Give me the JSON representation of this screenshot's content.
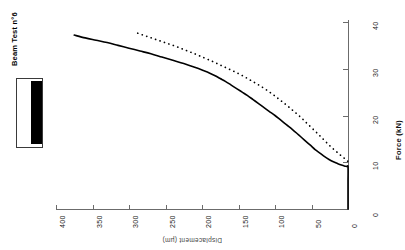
{
  "chart_data": {
    "type": "line",
    "title": "Beam Test n°6",
    "xlabel": "Displacement (µm)",
    "ylabel": "Force  (kN)",
    "xlim": [
      400,
      0
    ],
    "ylim": [
      0,
      40
    ],
    "x_ticks": [
      "400",
      "350",
      "300",
      "250",
      "200",
      "150",
      "100",
      "50",
      "0"
    ],
    "y_ticks": [
      "0",
      "10",
      "20",
      "30",
      "40"
    ],
    "grid": false,
    "x_axis_direction": "reversed",
    "legend": {
      "position": "left",
      "entries": [
        {
          "name": "Beam Test n°6",
          "style": "solid-block"
        }
      ]
    },
    "series": [
      {
        "name": "Beam Test n°6 experimental",
        "style": "solid",
        "points": [
          [
            375,
            37.2
          ],
          [
            360,
            36.6
          ],
          [
            345,
            36.1
          ],
          [
            330,
            35.6
          ],
          [
            315,
            35.0
          ],
          [
            300,
            34.4
          ],
          [
            285,
            33.8
          ],
          [
            270,
            33.2
          ],
          [
            255,
            32.5
          ],
          [
            240,
            31.8
          ],
          [
            225,
            31.1
          ],
          [
            210,
            30.3
          ],
          [
            198,
            29.6
          ],
          [
            190,
            29.1
          ],
          [
            182,
            28.5
          ],
          [
            175,
            27.9
          ],
          [
            168,
            27.3
          ],
          [
            160,
            26.5
          ],
          [
            152,
            25.7
          ],
          [
            145,
            25.0
          ],
          [
            138,
            24.3
          ],
          [
            130,
            23.4
          ],
          [
            122,
            22.5
          ],
          [
            115,
            21.7
          ],
          [
            108,
            20.9
          ],
          [
            100,
            20.0
          ],
          [
            92,
            19.0
          ],
          [
            84,
            18.0
          ],
          [
            76,
            17.0
          ],
          [
            68,
            15.9
          ],
          [
            60,
            14.8
          ],
          [
            52,
            13.7
          ],
          [
            45,
            12.7
          ],
          [
            38,
            11.9
          ],
          [
            32,
            11.2
          ],
          [
            26,
            10.6
          ],
          [
            20,
            10.1
          ],
          [
            14,
            9.7
          ],
          [
            9,
            9.4
          ],
          [
            5,
            9.2
          ],
          [
            2,
            9.1
          ],
          [
            0,
            9.0
          ],
          [
            0,
            6.0
          ],
          [
            0,
            3.0
          ],
          [
            0,
            0.0
          ]
        ]
      },
      {
        "name": "Beam Test n°6 model",
        "style": "dotted",
        "points": [
          [
            288,
            37.6
          ],
          [
            275,
            36.9
          ],
          [
            262,
            36.2
          ],
          [
            249,
            35.5
          ],
          [
            236,
            34.8
          ],
          [
            223,
            34.0
          ],
          [
            210,
            33.2
          ],
          [
            198,
            32.4
          ],
          [
            186,
            31.6
          ],
          [
            175,
            30.8
          ],
          [
            164,
            30.0
          ],
          [
            153,
            29.2
          ],
          [
            142,
            28.3
          ],
          [
            132,
            27.4
          ],
          [
            122,
            26.5
          ],
          [
            112,
            25.5
          ],
          [
            102,
            24.4
          ],
          [
            93,
            23.3
          ],
          [
            84,
            22.2
          ],
          [
            75,
            21.0
          ],
          [
            66,
            19.8
          ],
          [
            58,
            18.6
          ],
          [
            50,
            17.4
          ],
          [
            42,
            16.2
          ],
          [
            35,
            15.1
          ],
          [
            28,
            14.0
          ],
          [
            22,
            13.1
          ],
          [
            16,
            12.3
          ],
          [
            11,
            11.6
          ],
          [
            7,
            11.1
          ],
          [
            4,
            10.7
          ],
          [
            2,
            10.4
          ],
          [
            0,
            10.2
          ]
        ]
      }
    ]
  },
  "axes": {
    "force": {
      "title": "Force  (kN)",
      "ticks": [
        {
          "label": "0",
          "value": 0
        },
        {
          "label": "10",
          "value": 10
        },
        {
          "label": "20",
          "value": 20
        },
        {
          "label": "30",
          "value": 30
        },
        {
          "label": "40",
          "value": 40
        }
      ]
    },
    "displacement": {
      "title": "Displacement (µm)",
      "ticks": [
        {
          "label": "400",
          "value": 400
        },
        {
          "label": "350",
          "value": 350
        },
        {
          "label": "300",
          "value": 300
        },
        {
          "label": "250",
          "value": 250
        },
        {
          "label": "200",
          "value": 200
        },
        {
          "label": "150",
          "value": 150
        },
        {
          "label": "100",
          "value": 100
        },
        {
          "label": "50",
          "value": 50
        },
        {
          "label": "0",
          "value": 0
        }
      ]
    }
  },
  "legend": {
    "label": "Beam Test n°6"
  },
  "colors": {
    "ink": "#000000",
    "axis": "#6b6b6b",
    "background": "#ffffff"
  }
}
